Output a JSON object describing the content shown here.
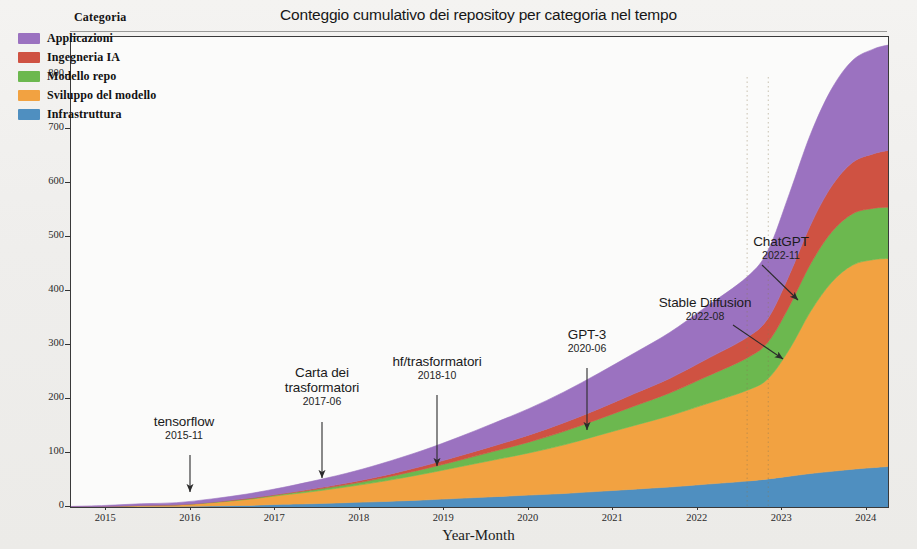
{
  "figure": {
    "title": "Conteggio cumulativo dei repositoy per categoria nel tempo",
    "xlabel": "Year-Month",
    "ylabel": "Conteggio cumulativo"
  },
  "legend": {
    "title": "Categoria",
    "items": [
      {
        "label": "Applicazioni",
        "color": "#9b72c0"
      },
      {
        "label": "Ingegneria IA",
        "color": "#cf5242"
      },
      {
        "label": "Modello repo",
        "color": "#6cb84f"
      },
      {
        "label": "Sviluppo del modello",
        "color": "#f2a241"
      },
      {
        "label": "Infrastruttura",
        "color": "#4f8fc0"
      }
    ]
  },
  "annotations": [
    {
      "name": "tensorflow",
      "date": "2015-11"
    },
    {
      "name": "Carta dei trasformatori",
      "date": "2017-06"
    },
    {
      "name": "hf/trasformatori",
      "date": "2018-10"
    },
    {
      "name": "GPT-3",
      "date": "2020-06"
    },
    {
      "name": "Stable Diffusion",
      "date": "2022-08"
    },
    {
      "name": "ChatGPT",
      "date": "2022-11"
    }
  ],
  "chart_data": {
    "type": "area",
    "title": "Conteggio cumulativo dei repositoy per categoria nel tempo",
    "xlabel": "Year-Month",
    "ylabel": "Conteggio cumulativo",
    "stacked": true,
    "grid": false,
    "legend_position": "upper left",
    "xlim": [
      "2014-08",
      "2024-04"
    ],
    "ylim": [
      0,
      870
    ],
    "xticks": [
      "2015",
      "2016",
      "2017",
      "2018",
      "2019",
      "2020",
      "2021",
      "2022",
      "2023",
      "2024"
    ],
    "yticks": [
      0,
      100,
      200,
      300,
      400,
      500,
      600,
      700,
      800
    ],
    "x": [
      "2014-08",
      "2015-01",
      "2015-06",
      "2015-11",
      "2016-04",
      "2016-09",
      "2017-02",
      "2017-06",
      "2017-11",
      "2018-04",
      "2018-10",
      "2019-03",
      "2019-08",
      "2020-01",
      "2020-06",
      "2020-11",
      "2021-04",
      "2021-09",
      "2022-02",
      "2022-08",
      "2022-11",
      "2023-02",
      "2023-05",
      "2023-08",
      "2023-11",
      "2024-02",
      "2024-04"
    ],
    "series": [
      {
        "name": "Infrastruttura",
        "color": "#4f8fc0",
        "values": [
          0,
          0,
          1,
          1,
          2,
          3,
          5,
          6,
          8,
          10,
          13,
          16,
          19,
          22,
          25,
          29,
          33,
          37,
          42,
          48,
          52,
          57,
          62,
          66,
          70,
          73,
          75
        ]
      },
      {
        "name": "Sviluppo del modello",
        "color": "#f2a241",
        "values": [
          0,
          1,
          2,
          3,
          6,
          11,
          17,
          22,
          29,
          37,
          48,
          58,
          68,
          78,
          90,
          104,
          118,
          132,
          148,
          168,
          186,
          235,
          300,
          350,
          378,
          385,
          385
        ]
      },
      {
        "name": "Modello repo",
        "color": "#6cb84f",
        "values": [
          0,
          0,
          0,
          0,
          1,
          1,
          2,
          3,
          4,
          6,
          9,
          12,
          16,
          20,
          25,
          30,
          36,
          42,
          50,
          60,
          68,
          80,
          88,
          93,
          95,
          95,
          95
        ]
      },
      {
        "name": "Ingegneria IA",
        "color": "#cf5242",
        "values": [
          0,
          0,
          0,
          0,
          0,
          1,
          1,
          2,
          3,
          4,
          6,
          8,
          10,
          13,
          16,
          19,
          23,
          27,
          32,
          38,
          44,
          58,
          72,
          85,
          95,
          101,
          105
        ]
      },
      {
        "name": "Applicazioni",
        "color": "#9b72c0",
        "values": [
          1,
          2,
          3,
          4,
          6,
          8,
          11,
          14,
          18,
          23,
          29,
          35,
          42,
          49,
          57,
          66,
          75,
          85,
          97,
          112,
          126,
          150,
          168,
          180,
          189,
          194,
          195
        ]
      }
    ],
    "series_totals_at_end": {
      "Infrastruttura": 75,
      "Sviluppo del modello": 385,
      "Modello repo": 95,
      "Ingegneria IA": 105,
      "Applicazioni": 195,
      "total": 855
    },
    "event_markers": [
      {
        "label": "tensorflow",
        "date": "2015-11"
      },
      {
        "label": "Carta dei trasformatori",
        "date": "2017-06"
      },
      {
        "label": "hf/trasformatori",
        "date": "2018-10"
      },
      {
        "label": "GPT-3",
        "date": "2020-06"
      },
      {
        "label": "Stable Diffusion",
        "date": "2022-08"
      },
      {
        "label": "ChatGPT",
        "date": "2022-11"
      }
    ]
  }
}
